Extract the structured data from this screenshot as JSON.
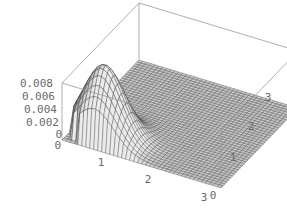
{
  "chart_data": {
    "type": "surface3d",
    "title": "",
    "xlabel": "",
    "ylabel": "",
    "zlabel": "",
    "x_ticks": [
      "0",
      "1",
      "2",
      "3"
    ],
    "y_ticks": [
      "0",
      "1",
      "2",
      "3"
    ],
    "z_ticks": [
      "0",
      "0.002",
      "0.004",
      "0.006",
      "0.008"
    ],
    "xlim": [
      0,
      3
    ],
    "ylim": [
      0,
      3
    ],
    "zlim": [
      0,
      0.008
    ],
    "grid": false,
    "box": true,
    "mesh_resolution": 40,
    "surface_color": "#c8c8c8",
    "mesh_color": "#3a3a3a",
    "box_color": "#9a9a9a",
    "peak": {
      "x": 0.55,
      "y": 0.45,
      "z": 0.0082
    }
  },
  "labels": {
    "z": [
      "0.008",
      "0.006",
      "0.004",
      "0.002",
      "0",
      "0"
    ],
    "x": [
      "0",
      "1",
      "2",
      "3"
    ],
    "y": [
      "0",
      "1",
      "2",
      "3"
    ]
  }
}
